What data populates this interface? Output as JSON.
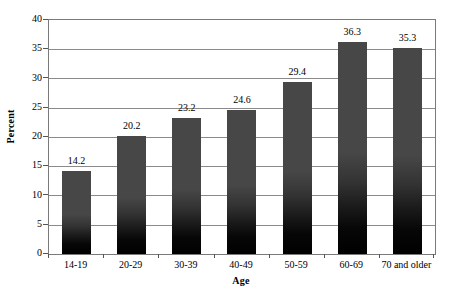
{
  "chart_data": {
    "type": "bar",
    "title": "",
    "subtitle": "",
    "xlabel": "Age",
    "ylabel": "Percent",
    "categories": [
      "14-19",
      "20-29",
      "30-39",
      "40-49",
      "50-59",
      "60-69",
      "70 and older"
    ],
    "values": [
      14.2,
      20.2,
      23.2,
      24.6,
      29.4,
      36.3,
      35.3
    ],
    "data_labels": [
      "14.2",
      "20.2",
      "23.2",
      "24.6",
      "29.4",
      "36.3",
      "35.3"
    ],
    "ylim": [
      0,
      40
    ],
    "ytick_step": 5,
    "ytick_labels": [
      "40",
      "35",
      "30",
      "25",
      "20",
      "15",
      "10",
      "5",
      "0"
    ],
    "ytick_values": [
      40,
      35,
      30,
      25,
      20,
      15,
      10,
      5,
      0
    ],
    "grid": "horizontal",
    "legend": "none",
    "series": [
      {
        "name": "Percent",
        "values": [
          14.2,
          20.2,
          23.2,
          24.6,
          29.4,
          36.3,
          35.3
        ]
      }
    ],
    "colors": {
      "bar_top": "#474747",
      "bar_bottom": "#000000",
      "gridline": "#8a8a8a",
      "axis_border": "#7a7a7a",
      "text": "#000000",
      "background": "#ffffff"
    }
  }
}
